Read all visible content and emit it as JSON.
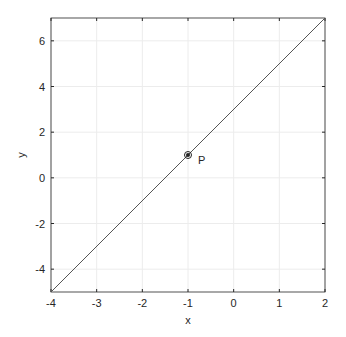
{
  "chart_data": {
    "type": "line",
    "title": "",
    "xlabel": "x",
    "ylabel": "y",
    "xlim": [
      -4,
      2
    ],
    "ylim": [
      -5,
      7
    ],
    "grid": true,
    "xticks": [
      "-4",
      "-3",
      "-2",
      "-1",
      "0",
      "1",
      "2"
    ],
    "yticks": [
      "-4",
      "-2",
      "0",
      "2",
      "4",
      "6"
    ],
    "series": [
      {
        "name": "line",
        "x": [
          -4,
          2
        ],
        "y": [
          -5,
          7
        ],
        "color": "#555555"
      }
    ],
    "points": [
      {
        "label": "P",
        "x": -1,
        "y": 1
      }
    ]
  }
}
